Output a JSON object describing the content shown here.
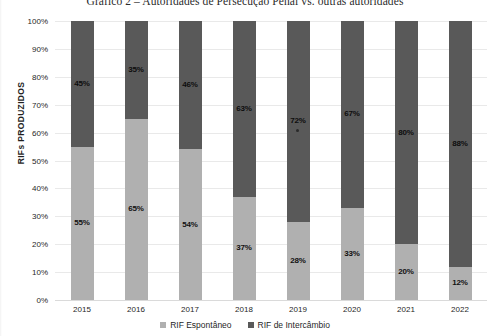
{
  "chart_data": {
    "type": "bar",
    "title": "Gráfico 2 – Autoridades de Persecução Penal vs. outras autoridades",
    "xlabel": "",
    "ylabel": "RIFs PRODUZIDOS",
    "stacked": true,
    "normalized_100_percent": true,
    "ylim": [
      0,
      100
    ],
    "grid": true,
    "legend_position": "bottom",
    "categories": [
      "2015",
      "2016",
      "2017",
      "2018",
      "2019",
      "2020",
      "2021",
      "2022"
    ],
    "y_ticks": [
      "0%",
      "10%",
      "20%",
      "30%",
      "40%",
      "50%",
      "60%",
      "70%",
      "80%",
      "90%",
      "100%"
    ],
    "series": [
      {
        "name": "RIF Espontâneo",
        "color": "#b0b0b0",
        "values": [
          55,
          65,
          54,
          37,
          28,
          33,
          20,
          12
        ],
        "labels": [
          "55%",
          "65%",
          "54%",
          "37%",
          "28%",
          "33%",
          "20%",
          "12%"
        ]
      },
      {
        "name": "RIF de Intercâmbio",
        "color": "#595959",
        "values": [
          45,
          35,
          46,
          63,
          72,
          67,
          80,
          88
        ],
        "labels": [
          "45%",
          "35%",
          "46%",
          "63%",
          "72%",
          "67%",
          "80%",
          "88%"
        ]
      }
    ]
  },
  "legend": {
    "items": [
      {
        "label": "RIF Espontâneo",
        "swatch": "light"
      },
      {
        "label": "RIF de Intercâmbio",
        "swatch": "dark"
      }
    ]
  }
}
